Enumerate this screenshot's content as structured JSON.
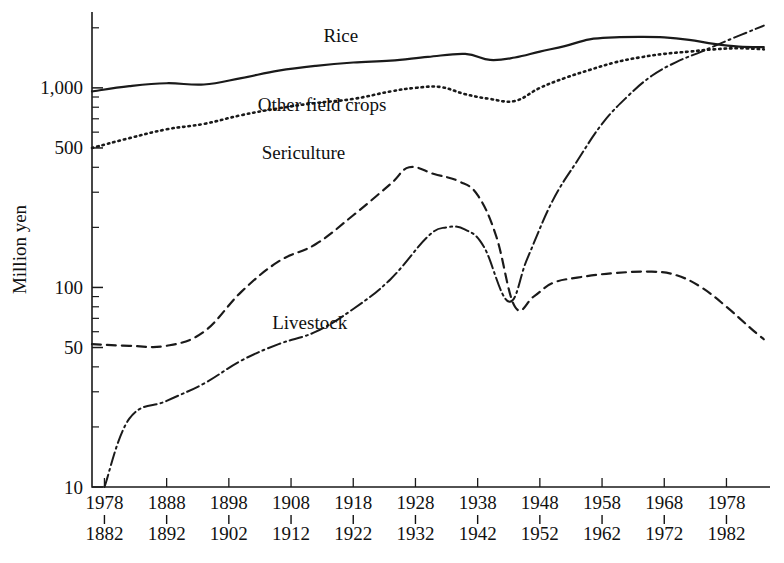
{
  "figure": {
    "width": 784,
    "height": 563,
    "background": "#ffffff",
    "ink_color": "#1a1a1a"
  },
  "chart_data": {
    "type": "line",
    "title": "",
    "subtitle": "",
    "xlabel": "",
    "ylabel": "Million yen",
    "yscale": "log",
    "ylim": [
      10,
      2400
    ],
    "xlim": [
      1878,
      1987
    ],
    "grid": false,
    "legend_position": "inline-annotations",
    "y_major_ticks": [
      10,
      50,
      100,
      500,
      1000
    ],
    "y_major_tick_labels": [
      "10",
      "50",
      "100",
      "500",
      "1,000"
    ],
    "y_minor_ticks": [
      20,
      30,
      40,
      60,
      70,
      80,
      90,
      200,
      300,
      400,
      600,
      700,
      800,
      900,
      2000
    ],
    "x_tick_top_labels": [
      "1978",
      "1888",
      "1898",
      "1908",
      "1918",
      "1928",
      "1938",
      "1948",
      "1958",
      "1968",
      "1978"
    ],
    "x_tick_bottom_labels": [
      "1882",
      "1892",
      "1902",
      "1912",
      "1922",
      "1932",
      "1942",
      "1952",
      "1962",
      "1972",
      "1982"
    ],
    "x_tick_values": [
      1880,
      1890,
      1900,
      1910,
      1920,
      1930,
      1940,
      1950,
      1960,
      1970,
      1980
    ],
    "series": [
      {
        "name": "Rice",
        "linestyle": "solid",
        "dasharray": "none",
        "stroke_width": 2.2,
        "label_x": 1918,
        "label_y": 1700,
        "x": [
          1878,
          1884,
          1890,
          1896,
          1902,
          1908,
          1914,
          1920,
          1926,
          1932,
          1938,
          1942,
          1946,
          1950,
          1954,
          1958,
          1962,
          1966,
          1970,
          1974,
          1978,
          1982,
          1986
        ],
        "y": [
          960,
          1020,
          1055,
          1040,
          1120,
          1220,
          1290,
          1340,
          1370,
          1430,
          1480,
          1380,
          1420,
          1520,
          1620,
          1750,
          1790,
          1800,
          1790,
          1740,
          1660,
          1610,
          1600
        ]
      },
      {
        "name": "Other field crops",
        "linestyle": "dotted",
        "dasharray": "1.5 4",
        "stroke_width": 2.6,
        "label_x": 1915,
        "label_y": 770,
        "x": [
          1878,
          1884,
          1890,
          1896,
          1902,
          1908,
          1914,
          1920,
          1926,
          1930,
          1934,
          1938,
          1942,
          1946,
          1950,
          1954,
          1958,
          1962,
          1966,
          1970,
          1974,
          1978,
          1982,
          1986
        ],
        "y": [
          500,
          560,
          620,
          660,
          730,
          790,
          840,
          880,
          960,
          1000,
          1010,
          930,
          880,
          860,
          1000,
          1120,
          1230,
          1340,
          1420,
          1480,
          1520,
          1560,
          1580,
          1560
        ]
      },
      {
        "name": "Sericulture",
        "linestyle": "dashed",
        "dasharray": "9 6",
        "stroke_width": 2.2,
        "label_x": 1912,
        "label_y": 440,
        "x": [
          1878,
          1884,
          1890,
          1896,
          1902,
          1908,
          1914,
          1920,
          1926,
          1929,
          1933,
          1937,
          1940,
          1943,
          1946,
          1949,
          1952,
          1956,
          1962,
          1968,
          1972,
          1976,
          1980,
          1984,
          1986
        ],
        "y": [
          52,
          51,
          51,
          60,
          95,
          135,
          165,
          230,
          330,
          400,
          370,
          340,
          290,
          180,
          80,
          90,
          105,
          112,
          118,
          120,
          115,
          100,
          80,
          62,
          55
        ]
      },
      {
        "name": "Livestock",
        "linestyle": "dashdot",
        "dasharray": "13 4 2 4",
        "stroke_width": 2.0,
        "label_x": 1913,
        "label_y": 62,
        "x": [
          1880,
          1884,
          1890,
          1896,
          1902,
          1908,
          1914,
          1920,
          1926,
          1932,
          1935,
          1938,
          1941,
          1945,
          1948,
          1952,
          1956,
          1960,
          1964,
          1968,
          1972,
          1976,
          1980,
          1986
        ],
        "y": [
          10,
          22,
          27,
          33,
          43,
          52,
          60,
          78,
          110,
          180,
          200,
          195,
          160,
          85,
          140,
          270,
          430,
          660,
          900,
          1150,
          1350,
          1520,
          1720,
          2050
        ]
      }
    ]
  },
  "annotations": {
    "rice_label": "Rice",
    "other_field_crops_label": "Other field crops",
    "sericulture_label": "Sericulture",
    "livestock_label": "Livestock",
    "y_axis_title": "Million yen"
  }
}
